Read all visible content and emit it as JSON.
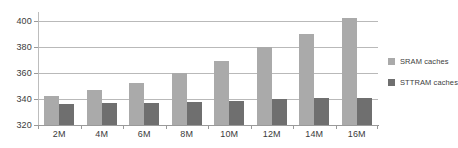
{
  "chart_data": {
    "type": "bar",
    "title": "",
    "subtitle": "",
    "xlabel": "",
    "ylabel": "",
    "categories": [
      "2M",
      "4M",
      "6M",
      "8M",
      "10M",
      "12M",
      "14M",
      "16M"
    ],
    "series": [
      {
        "name": "SRAM caches",
        "color": "#aaaaaa",
        "values": [
          342,
          347,
          352,
          360,
          369,
          380,
          390,
          402
        ]
      },
      {
        "name": "STTRAM caches",
        "color": "#6f6f6f",
        "values": [
          336,
          336.5,
          337,
          337.5,
          338.5,
          340,
          340.5,
          341
        ]
      }
    ],
    "ylim": [
      320,
      405
    ],
    "yticks": [
      320,
      340,
      360,
      380,
      400
    ],
    "ytick_labels": [
      "320",
      "340",
      "360",
      "380",
      "400"
    ],
    "grid": true,
    "grid_axis": "y",
    "legend_position": "right",
    "legend": [
      "SRAM caches",
      "STTRAM caches"
    ]
  }
}
